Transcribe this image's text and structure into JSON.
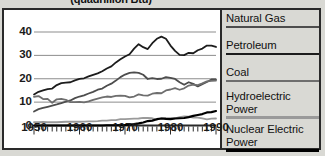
{
  "figure": {
    "title": "(quadrillion Btu)",
    "background_color": "#d9d9d4",
    "plot_background_color": "#ffffff",
    "frame_color": "#2a2a2a"
  },
  "legend": {
    "position": "right",
    "items": [
      {
        "label": "Natural Gas",
        "color": "#4d4d4d",
        "swatch": "legend-swatch-natural-gas"
      },
      {
        "label": "Petroleum",
        "color": "#1c1c1c",
        "swatch": "legend-swatch-petroleum"
      },
      {
        "label": "Coal",
        "color": "#6e6e6e",
        "swatch": "legend-swatch-coal"
      },
      {
        "label": "Hydroelectric Power",
        "color": "#9a9a9a",
        "swatch": "legend-swatch-hydroelectric-power"
      },
      {
        "label": "Nuclear Electric Power",
        "color": "#000000",
        "swatch": "legend-swatch-nuclear-electric-power"
      }
    ]
  },
  "axes": {
    "y_ticks": [
      "0",
      "10",
      "20",
      "30",
      "40"
    ],
    "x_ticks": [
      "1950",
      "1960",
      "1970",
      "1980",
      "1990"
    ]
  },
  "chart_data": {
    "type": "line",
    "title": "(quadrillion Btu)",
    "xlabel": "",
    "ylabel": "",
    "xlim": [
      1949,
      1991
    ],
    "ylim": [
      0,
      44
    ],
    "grid": "horizontal",
    "legend_position": "right",
    "x": [
      1950,
      1951,
      1952,
      1953,
      1954,
      1955,
      1956,
      1957,
      1958,
      1959,
      1960,
      1961,
      1962,
      1963,
      1964,
      1965,
      1966,
      1967,
      1968,
      1969,
      1970,
      1971,
      1972,
      1973,
      1974,
      1975,
      1976,
      1977,
      1978,
      1979,
      1980,
      1981,
      1982,
      1983,
      1984,
      1985,
      1986,
      1987,
      1988,
      1989,
      1990
    ],
    "series": [
      {
        "name": "Petroleum",
        "color": "#1c1c1c",
        "values": [
          13.3,
          14.4,
          15.0,
          15.6,
          15.8,
          17.3,
          18.1,
          18.3,
          18.5,
          19.3,
          19.9,
          20.2,
          21.0,
          21.7,
          22.3,
          23.2,
          24.4,
          25.3,
          27.0,
          28.3,
          29.5,
          30.5,
          32.9,
          34.8,
          33.5,
          32.7,
          35.2,
          37.1,
          38.0,
          37.1,
          34.2,
          31.9,
          30.2,
          30.1,
          31.1,
          30.9,
          32.2,
          32.9,
          34.2,
          34.2,
          33.6
        ]
      },
      {
        "name": "Natural Gas",
        "color": "#4d4d4d",
        "values": [
          6.0,
          7.0,
          7.5,
          8.0,
          8.5,
          9.0,
          9.6,
          10.2,
          10.7,
          11.7,
          12.4,
          12.9,
          13.7,
          14.4,
          15.3,
          15.8,
          17.0,
          17.9,
          19.2,
          20.7,
          21.8,
          22.5,
          22.7,
          22.5,
          21.7,
          19.9,
          20.3,
          19.9,
          20.0,
          20.7,
          20.4,
          19.9,
          18.5,
          17.4,
          18.5,
          17.8,
          16.7,
          17.7,
          18.6,
          19.7,
          19.7
        ]
      },
      {
        "name": "Coal",
        "color": "#6e6e6e",
        "values": [
          12.3,
          12.6,
          11.3,
          11.4,
          9.7,
          11.2,
          11.4,
          11.0,
          10.0,
          10.0,
          10.1,
          9.9,
          10.3,
          11.0,
          11.5,
          12.0,
          12.4,
          12.2,
          12.7,
          12.8,
          12.7,
          12.0,
          12.4,
          13.3,
          12.9,
          12.8,
          13.6,
          13.9,
          13.8,
          15.0,
          15.4,
          16.0,
          15.3,
          15.9,
          17.1,
          17.5,
          17.3,
          18.0,
          18.9,
          19.1,
          19.2
        ]
      },
      {
        "name": "Hydroelectric Power",
        "color": "#9a9a9a",
        "values": [
          1.4,
          1.4,
          1.5,
          1.4,
          1.4,
          1.4,
          1.5,
          1.6,
          1.6,
          1.6,
          1.6,
          1.7,
          1.8,
          1.8,
          1.9,
          2.1,
          2.1,
          2.3,
          2.3,
          2.7,
          2.7,
          2.8,
          2.9,
          3.0,
          3.3,
          3.2,
          3.1,
          2.5,
          3.1,
          3.1,
          3.1,
          3.1,
          3.6,
          3.9,
          3.8,
          3.4,
          3.4,
          3.0,
          2.6,
          2.9,
          3.0
        ]
      },
      {
        "name": "Nuclear Electric Power",
        "color": "#000000",
        "values": [
          0.0,
          0.0,
          0.0,
          0.0,
          0.0,
          0.0,
          0.0,
          0.0,
          0.0,
          0.0,
          0.0,
          0.0,
          0.0,
          0.0,
          0.0,
          0.0,
          0.1,
          0.1,
          0.1,
          0.2,
          0.2,
          0.4,
          0.6,
          0.9,
          1.3,
          1.9,
          2.1,
          2.7,
          3.0,
          2.8,
          2.7,
          3.0,
          3.1,
          3.2,
          3.6,
          4.1,
          4.5,
          4.9,
          5.6,
          5.7,
          6.2
        ]
      }
    ]
  }
}
